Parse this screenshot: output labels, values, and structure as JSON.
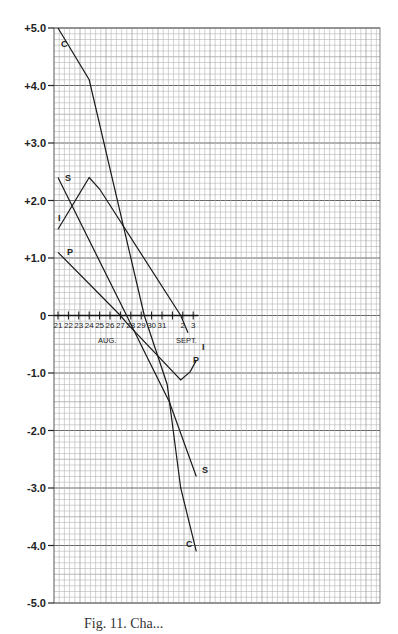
{
  "chart_data": {
    "type": "line",
    "title": "",
    "caption": "Fig. 11. Cha...",
    "xlabel": "AUG. / SEPT.",
    "ylabel": "",
    "ylim": [
      -5.0,
      5.0
    ],
    "grid": true,
    "y_ticks": [
      "+5.0",
      "+4.0",
      "+3.0",
      "+2.0",
      "+1.0",
      "0",
      "-1.0",
      "-2.0",
      "-3.0",
      "-4.0",
      "-5.0"
    ],
    "x_ticks": [
      "21",
      "22",
      "23",
      "24",
      "25",
      "26",
      "27",
      "28",
      "29",
      "30",
      "31",
      "1",
      "2",
      "3"
    ],
    "month_labels": [
      "AUG.",
      "SEPT."
    ],
    "x_day_index": "0 = Aug 21 ... 10 = Aug 31, 11 = Sept 1, 12 = Sept 2, 13 = Sept 3",
    "series": [
      {
        "name": "C",
        "points": [
          [
            0,
            5.0
          ],
          [
            3,
            4.1
          ],
          [
            8.3,
            0.0
          ],
          [
            10.5,
            -1.2
          ],
          [
            11.8,
            -3.0
          ],
          [
            13.3,
            -4.1
          ]
        ]
      },
      {
        "name": "S",
        "points": [
          [
            0,
            2.4
          ],
          [
            6.6,
            0.0
          ],
          [
            8.5,
            -0.7
          ],
          [
            10.7,
            -1.5
          ],
          [
            13.3,
            -2.8
          ]
        ]
      },
      {
        "name": "I",
        "points": [
          [
            0,
            1.5
          ],
          [
            3,
            2.4
          ],
          [
            4,
            2.2
          ],
          [
            11.8,
            0.0
          ],
          [
            12.5,
            -0.3
          ]
        ]
      },
      {
        "name": "P",
        "points": [
          [
            0,
            1.1
          ],
          [
            6.0,
            0.0
          ],
          [
            6.7,
            -0.15
          ],
          [
            11.8,
            -1.12
          ],
          [
            12.7,
            -0.98
          ],
          [
            13.3,
            -0.78
          ]
        ]
      }
    ],
    "legend": "Series labeled directly on lines: C, S, I, P"
  },
  "labels": {
    "aug": "AUG.",
    "sept": "SEPT.",
    "c_top": "C",
    "c_bottom": "C",
    "s_top": "S",
    "s_bottom": "S",
    "i_left": "I",
    "i_right": "I",
    "p_top": "P",
    "p_bottom": "P"
  },
  "caption": "Fig. 11. Cha..."
}
